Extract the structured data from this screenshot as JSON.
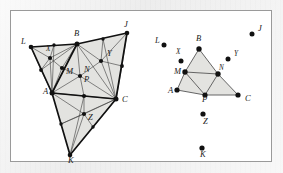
{
  "figure": {
    "panel": {
      "background_color": "#ffffff",
      "border_color": "#9a9a9a",
      "outer_background_color": "#ededed"
    },
    "style": {
      "fill_color": "#e3e3e0",
      "outline_color": "#1a1a1a",
      "inner_line_color": "#3a3a3a",
      "vertex_color": "#111111"
    },
    "left_diagram": {
      "name": "dense-triangulation",
      "labels": [
        {
          "text": "L",
          "x": 21,
          "y": 44
        },
        {
          "text": "B",
          "x": 74,
          "y": 36
        },
        {
          "text": "J",
          "x": 124,
          "y": 27
        },
        {
          "text": "A",
          "x": 43,
          "y": 94
        },
        {
          "text": "C",
          "x": 122,
          "y": 102
        },
        {
          "text": "K",
          "x": 68,
          "y": 163
        },
        {
          "text": "X",
          "x": 46,
          "y": 51
        },
        {
          "text": "M",
          "x": 66,
          "y": 74
        },
        {
          "text": "N",
          "x": 84,
          "y": 72
        },
        {
          "text": "P",
          "x": 84,
          "y": 82
        },
        {
          "text": "Y",
          "x": 107,
          "y": 56
        },
        {
          "text": "Z",
          "x": 88,
          "y": 120
        }
      ],
      "vertices": {
        "L": [
          31,
          47
        ],
        "B": [
          77,
          44
        ],
        "J": [
          127,
          33
        ],
        "A": [
          52,
          93
        ],
        "C": [
          116,
          99
        ],
        "K": [
          70,
          155
        ],
        "X": [
          50,
          58
        ],
        "M": [
          62,
          68
        ],
        "N": [
          80,
          76
        ],
        "Y": [
          101,
          61
        ],
        "Z": [
          84,
          114
        ],
        "LB_mid": [
          54,
          45
        ],
        "BJ_mid": [
          103,
          39
        ],
        "AC_mid": [
          84,
          96
        ],
        "AK_mid": [
          61,
          124
        ],
        "KC_mid": [
          93,
          127
        ],
        "LA_mid": [
          41,
          70
        ],
        "JC_mid": [
          122,
          66
        ]
      }
    },
    "right_diagram": {
      "name": "medial-triangle",
      "labels": [
        {
          "text": "L",
          "x": 155,
          "y": 43
        },
        {
          "text": "B",
          "x": 196,
          "y": 41
        },
        {
          "text": "J",
          "x": 258,
          "y": 31
        },
        {
          "text": "X",
          "x": 176,
          "y": 54
        },
        {
          "text": "Y",
          "x": 234,
          "y": 56
        },
        {
          "text": "M",
          "x": 174,
          "y": 74
        },
        {
          "text": "N",
          "x": 219,
          "y": 70
        },
        {
          "text": "A",
          "x": 168,
          "y": 93
        },
        {
          "text": "P",
          "x": 202,
          "y": 102
        },
        {
          "text": "C",
          "x": 245,
          "y": 101
        },
        {
          "text": "Z",
          "x": 203,
          "y": 124
        },
        {
          "text": "K",
          "x": 200,
          "y": 157
        }
      ],
      "vertices": {
        "L": [
          164,
          45
        ],
        "B": [
          199,
          49
        ],
        "J": [
          252,
          34
        ],
        "X": [
          181,
          61
        ],
        "Y": [
          228,
          59
        ],
        "M": [
          185,
          72
        ],
        "N": [
          218,
          74
        ],
        "A": [
          177,
          90
        ],
        "P": [
          205,
          95
        ],
        "C": [
          238,
          95
        ],
        "Z": [
          203,
          114
        ],
        "K": [
          202,
          148
        ]
      }
    }
  }
}
